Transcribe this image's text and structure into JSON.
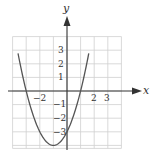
{
  "chart_data": {
    "type": "line",
    "title": "",
    "xlabel": "x",
    "ylabel": "y",
    "xlim": [
      -4,
      4
    ],
    "ylim": [
      -4,
      4
    ],
    "grid": true,
    "function": "y = x^2 + 2x - 3",
    "x": [
      -3.6,
      -3,
      -2,
      -1,
      0,
      1,
      1.6
    ],
    "values": [
      2.76,
      0,
      -3,
      -4,
      -3,
      0,
      2.76
    ],
    "x_tick_labels": [
      {
        "value": -2,
        "label": "−2"
      },
      {
        "value": 2,
        "label": "2"
      },
      {
        "value": 3,
        "label": "3"
      }
    ],
    "y_tick_labels": [
      {
        "value": 3,
        "label": "3"
      },
      {
        "value": 2,
        "label": "2"
      },
      {
        "value": 1,
        "label": "1"
      },
      {
        "value": -1,
        "label": "−1"
      },
      {
        "value": -2,
        "label": "−2"
      },
      {
        "value": -3,
        "label": "−3"
      }
    ],
    "colors": {
      "curve": "#555555",
      "grid": "#cccccc",
      "axis": "#333333"
    }
  },
  "labels": {
    "x_axis": "x",
    "y_axis": "y",
    "xt_m2": "−2",
    "xt_2": "2",
    "xt_3": "3",
    "yt_3": "3",
    "yt_2": "2",
    "yt_1": "1",
    "yt_m1": "−1",
    "yt_m2": "−2",
    "yt_m3": "−3"
  }
}
